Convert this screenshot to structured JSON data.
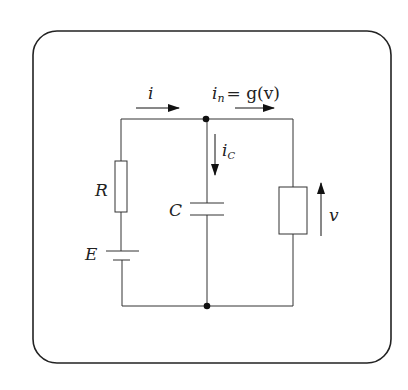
{
  "diagram": {
    "type": "electrical-circuit",
    "frame": {
      "style": "rounded-rectangle"
    },
    "labels": {
      "current_i": "i",
      "current_in_base": "i",
      "current_in_sub": "n",
      "current_in_eq": "= g(v)",
      "current_ic_base": "i",
      "current_ic_sub": "C",
      "resistor": "R",
      "capacitor": "C",
      "source": "E",
      "voltage": "v"
    },
    "components": [
      {
        "id": "R",
        "kind": "resistor",
        "branch": "left"
      },
      {
        "id": "E",
        "kind": "dc-voltage-source",
        "branch": "left"
      },
      {
        "id": "C",
        "kind": "capacitor",
        "branch": "middle"
      },
      {
        "id": "NL",
        "kind": "nonlinear-element",
        "branch": "right",
        "relation": "i_n = g(v)"
      }
    ],
    "arrows": [
      {
        "label": "i",
        "direction": "right",
        "position": "top-left wire"
      },
      {
        "label": "i_n = g(v)",
        "direction": "right",
        "position": "top-right wire"
      },
      {
        "label": "i_C",
        "direction": "down",
        "position": "middle branch"
      },
      {
        "label": "v",
        "direction": "up",
        "position": "beside nonlinear element"
      }
    ],
    "nodes": [
      "top-junction",
      "bottom-junction"
    ],
    "colors": {
      "stroke": "#222222",
      "background": "#ffffff"
    }
  }
}
